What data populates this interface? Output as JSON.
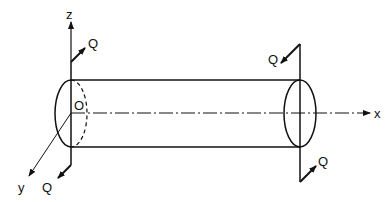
{
  "diagram": {
    "type": "cylinder-shear-forces",
    "labels": {
      "z_axis": "z",
      "y_axis": "y",
      "x_axis": "x",
      "origin": "O",
      "force_top_left": "Q",
      "force_bottom_left": "Q",
      "force_top_right": "Q",
      "force_bottom_right": "Q"
    },
    "colors": {
      "stroke": "#111111",
      "background": "#ffffff"
    }
  }
}
